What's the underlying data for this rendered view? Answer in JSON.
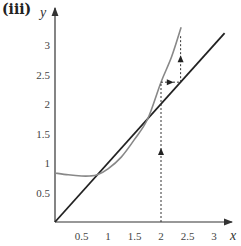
{
  "part_label": "(iii)",
  "chart_data": {
    "type": "line",
    "title": "(iii)",
    "xlabel": "x",
    "ylabel": "y",
    "xlim": [
      0,
      3.3
    ],
    "ylim": [
      0,
      3.4
    ],
    "grid": false,
    "x_ticks": [
      "0.5",
      "1",
      "1.5",
      "2",
      "2.5",
      "3"
    ],
    "y_ticks": [
      "0.5",
      "1",
      "1.5",
      "2",
      "2.5",
      "3"
    ],
    "series": [
      {
        "name": "y = x",
        "color": "#222222",
        "x": [
          0,
          3.2
        ],
        "y": [
          0,
          3.2
        ]
      },
      {
        "name": "y = g(x)",
        "color": "#888888",
        "x": [
          0,
          0.25,
          0.5,
          0.65,
          0.8,
          1.0,
          1.25,
          1.5,
          1.75,
          2.0,
          2.2,
          2.38
        ],
        "y": [
          0.83,
          0.8,
          0.78,
          0.78,
          0.8,
          0.9,
          1.1,
          1.4,
          1.75,
          2.37,
          2.8,
          3.3
        ]
      }
    ],
    "annotations": {
      "cobweb": [
        {
          "from": [
            2,
            0
          ],
          "to": [
            2,
            2.37
          ],
          "style": "dashed",
          "arrow": "up"
        },
        {
          "from": [
            2,
            2.37
          ],
          "to": [
            2.37,
            2.37
          ],
          "style": "dashed",
          "arrow": "right"
        },
        {
          "from": [
            2.37,
            2.37
          ],
          "to": [
            2.37,
            3.15
          ],
          "style": "dashed",
          "arrow": "up"
        }
      ],
      "intersections": [
        [
          0.78,
          0.78
        ],
        [
          1.75,
          1.75
        ]
      ]
    }
  }
}
